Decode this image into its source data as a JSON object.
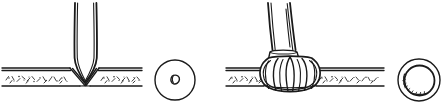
{
  "figure": {
    "background_color": "#ffffff",
    "ink_color": "#1a1a1a",
    "speckle_color": "#2b2b2b",
    "width": 444,
    "height": 109,
    "panel_count": 2,
    "caption": "",
    "labels": []
  },
  "panels": [
    {
      "id": "left-panel",
      "name": "v-groove-joint-panel",
      "description": "V-shaped tapered tool seated in a speckled horizontal strip, forming a pointed V notch through the strip",
      "elements": {
        "tool": {
          "name": "tapered-v-tool",
          "shape": "funnel",
          "apex_x": 85,
          "apex_y": 82,
          "top_left_x": 75,
          "top_right_x": 96,
          "top_y": 3
        },
        "strip": {
          "name": "speckled-strip",
          "top_y": 68,
          "bottom_y": 86,
          "left_x": 2,
          "right_x": 142,
          "fill": "speckled"
        },
        "section_circle": {
          "name": "v-section-circle",
          "center_x": 175,
          "center_y": 80,
          "radius": 20,
          "inner_shape": "small-oval-hole"
        }
      }
    },
    {
      "id": "right-panel",
      "name": "bulb-head-joint-panel",
      "description": "Bulbous petal-segmented head seated on a speckled horizontal strip with twin stems rising above",
      "elements": {
        "tool": {
          "name": "twin-stem-shaft",
          "left_stem_top_x": 268,
          "right_stem_top_x": 290,
          "top_y": 3,
          "neck_y": 50
        },
        "bulb": {
          "name": "petal-bulb-head",
          "center_x": 290,
          "center_y": 74,
          "radius_x": 28,
          "radius_y": 26,
          "petal_count": 5
        },
        "strip": {
          "name": "speckled-strip",
          "top_y": 68,
          "bottom_y": 86,
          "left_x": 226,
          "right_x": 384,
          "fill": "speckled"
        },
        "section_circle": {
          "name": "annulus-section-circle",
          "center_x": 419,
          "center_y": 80,
          "outer_radius": 21,
          "inner_radius": 15,
          "inner_shape": "annulus"
        }
      }
    }
  ]
}
